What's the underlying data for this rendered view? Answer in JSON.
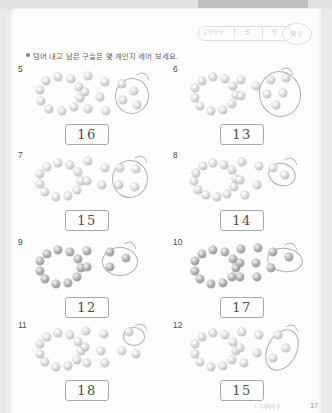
{
  "page": {
    "language": "ko",
    "top_tab_dots": "• •    • •"
  },
  "header": {
    "date_label": "공부한 날",
    "month_unit": "월",
    "day_unit": "일",
    "stamp_label": "확인",
    "stamp_ticks": "· · ·"
  },
  "instruction": {
    "bullet": "bullet-icon",
    "text": "덬어 내고 남은 구슬은 몇 개인지 세어 보세요."
  },
  "problems": [
    {
      "number": "5",
      "answer": "16",
      "shade": "light",
      "ring": {
        "cx": 30,
        "cy": 28,
        "rx": 21,
        "ry": 17,
        "count": 10,
        "start_angle": -95
      },
      "loose": [
        {
          "x": 58,
          "y": 10
        },
        {
          "x": 75,
          "y": 16
        },
        {
          "x": 55,
          "y": 26
        },
        {
          "x": 70,
          "y": 31
        },
        {
          "x": 58,
          "y": 43
        },
        {
          "x": 76,
          "y": 45
        }
      ],
      "removed": [
        {
          "x": 92,
          "y": 18
        },
        {
          "x": 104,
          "y": 25
        },
        {
          "x": 93,
          "y": 34
        },
        {
          "x": 107,
          "y": 39
        }
      ],
      "lasso": {
        "x": 85,
        "y": 12,
        "w": 32,
        "h": 34,
        "rot": 8
      },
      "tail": {
        "x": 108,
        "y": 6
      }
    },
    {
      "number": "6",
      "answer": "13",
      "shade": "light",
      "ring": {
        "cx": 30,
        "cy": 28,
        "rx": 21,
        "ry": 17,
        "count": 11,
        "start_angle": -95
      },
      "loose": [
        {
          "x": 56,
          "y": 14
        },
        {
          "x": 71,
          "y": 20
        },
        {
          "x": 56,
          "y": 30
        }
      ],
      "removed": [
        {
          "x": 86,
          "y": 14
        },
        {
          "x": 101,
          "y": 12
        },
        {
          "x": 82,
          "y": 28
        },
        {
          "x": 98,
          "y": 27
        },
        {
          "x": 91,
          "y": 39
        }
      ],
      "lasso": {
        "x": 74,
        "y": 5,
        "w": 40,
        "h": 44,
        "rot": -12
      },
      "tail": {
        "x": 97,
        "y": 1
      }
    },
    {
      "number": "7",
      "answer": "15",
      "shade": "light",
      "ring": {
        "cx": 30,
        "cy": 28,
        "rx": 21,
        "ry": 17,
        "count": 11,
        "start_angle": -95
      },
      "loose": [
        {
          "x": 58,
          "y": 9
        },
        {
          "x": 75,
          "y": 16
        },
        {
          "x": 57,
          "y": 29
        },
        {
          "x": 72,
          "y": 33
        }
      ],
      "removed": [
        {
          "x": 90,
          "y": 16
        },
        {
          "x": 106,
          "y": 17
        },
        {
          "x": 89,
          "y": 33
        },
        {
          "x": 105,
          "y": 35
        }
      ],
      "lasso": {
        "x": 82,
        "y": 8,
        "w": 34,
        "h": 36,
        "rot": 5
      },
      "tail": {
        "x": 106,
        "y": 3
      }
    },
    {
      "number": "8",
      "answer": "14",
      "shade": "light",
      "ring": {
        "cx": 30,
        "cy": 28,
        "rx": 21,
        "ry": 17,
        "count": 12,
        "start_angle": -95
      },
      "loose": [
        {
          "x": 57,
          "y": 10
        },
        {
          "x": 74,
          "y": 14
        },
        {
          "x": 55,
          "y": 28
        },
        {
          "x": 72,
          "y": 33
        },
        {
          "x": 60,
          "y": 43
        }
      ],
      "removed": [
        {
          "x": 88,
          "y": 16
        },
        {
          "x": 100,
          "y": 23
        }
      ],
      "lasso": {
        "x": 83,
        "y": 11,
        "w": 26,
        "h": 21,
        "rot": 18
      },
      "tail": {
        "x": 101,
        "y": 5
      }
    },
    {
      "number": "9",
      "answer": "12",
      "shade": "dark",
      "ring": {
        "cx": 30,
        "cy": 28,
        "rx": 21,
        "ry": 17,
        "count": 11,
        "start_angle": -95
      },
      "loose": [
        {
          "x": 57,
          "y": 12
        },
        {
          "x": 57,
          "y": 28
        }
      ],
      "removed": [
        {
          "x": 80,
          "y": 13
        },
        {
          "x": 96,
          "y": 19
        },
        {
          "x": 80,
          "y": 28
        }
      ],
      "lasso": {
        "x": 72,
        "y": 8,
        "w": 34,
        "h": 27,
        "rot": 0
      },
      "tail": {
        "x": 95,
        "y": 2
      }
    },
    {
      "number": "10",
      "answer": "17",
      "shade": "dark",
      "ring": {
        "cx": 30,
        "cy": 28,
        "rx": 21,
        "ry": 17,
        "count": 11,
        "start_angle": -95
      },
      "loose": [
        {
          "x": 56,
          "y": 10
        },
        {
          "x": 73,
          "y": 9
        },
        {
          "x": 55,
          "y": 24
        },
        {
          "x": 71,
          "y": 24
        },
        {
          "x": 55,
          "y": 38
        },
        {
          "x": 72,
          "y": 38
        }
      ],
      "removed": [
        {
          "x": 88,
          "y": 13
        },
        {
          "x": 104,
          "y": 18
        },
        {
          "x": 86,
          "y": 29
        }
      ],
      "lasso": {
        "x": 82,
        "y": 9,
        "w": 34,
        "h": 22,
        "rot": 8
      },
      "tail": {
        "x": 101,
        "y": 3
      }
    },
    {
      "number": "11",
      "answer": "18",
      "shade": "light",
      "ring": {
        "cx": 30,
        "cy": 28,
        "rx": 21,
        "ry": 17,
        "count": 11,
        "start_angle": -95
      },
      "loose": [
        {
          "x": 56,
          "y": 9
        },
        {
          "x": 74,
          "y": 12
        },
        {
          "x": 55,
          "y": 25
        },
        {
          "x": 71,
          "y": 29
        },
        {
          "x": 57,
          "y": 41
        },
        {
          "x": 75,
          "y": 41
        },
        {
          "x": 92,
          "y": 29
        },
        {
          "x": 106,
          "y": 32
        }
      ],
      "removed": [
        {
          "x": 99,
          "y": 10
        }
      ],
      "lasso": {
        "x": 93,
        "y": 5,
        "w": 20,
        "h": 17,
        "rot": 0
      },
      "tail": {
        "x": 106,
        "y": 1
      }
    },
    {
      "number": "12",
      "answer": "15",
      "shade": "light",
      "ring": {
        "cx": 30,
        "cy": 28,
        "rx": 21,
        "ry": 17,
        "count": 11,
        "start_angle": -95
      },
      "loose": [
        {
          "x": 57,
          "y": 10
        },
        {
          "x": 74,
          "y": 13
        },
        {
          "x": 55,
          "y": 26
        },
        {
          "x": 72,
          "y": 31
        },
        {
          "x": 59,
          "y": 41
        }
      ],
      "removed": [
        {
          "x": 93,
          "y": 13
        },
        {
          "x": 101,
          "y": 26
        },
        {
          "x": 88,
          "y": 36
        }
      ],
      "lasso": {
        "x": 82,
        "y": 6,
        "w": 28,
        "h": 42,
        "rot": 28
      },
      "tail": {
        "x": 102,
        "y": 2
      }
    }
  ],
  "footer": {
    "note": "1. 리개까지 수",
    "page_number": "17"
  }
}
